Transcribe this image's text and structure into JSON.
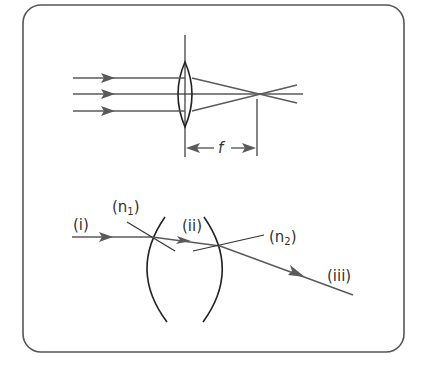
{
  "figure": {
    "top_diagram": {
      "name": "convex-lens-focal-length",
      "focal_label": "f",
      "incident_ray_count": 3
    },
    "bottom_diagram": {
      "name": "refraction-through-lens-surfaces",
      "labels": {
        "incident_ray": "(i)",
        "normal_1_open": "(n",
        "normal_1_sub": "1",
        "normal_1_close": ")",
        "internal_ray": "(ii)",
        "normal_2_open": "(n",
        "normal_2_sub": "2",
        "normal_2_close": ")",
        "emergent_ray": "(iii)"
      }
    }
  },
  "colors": {
    "ray": "#5a5a5a",
    "lens": "#222222",
    "frame": "#555555",
    "background": "#ffffff"
  }
}
